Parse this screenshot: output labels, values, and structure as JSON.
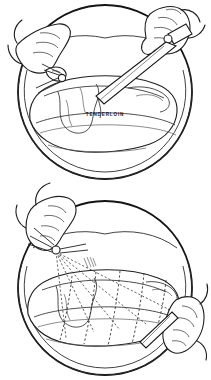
{
  "figure": {
    "style": "black-and-white line drawing",
    "panel_count": 2,
    "background_color": "#ffffff",
    "ink_color": "#1a1a1a"
  },
  "panels": [
    {
      "id": "panel-top",
      "order": 1,
      "shape": "circle",
      "center_x": 105,
      "center_y": 92,
      "radius": 88,
      "scene": "Two hands at a platter: the left hand steadies the roast with a carving fork while the right hand guides a carving knife along the edge of the tenderloin muscle.",
      "labels": [
        {
          "id": "tenderloin-label",
          "text": "TENDERLOIN",
          "x": 105,
          "y": 115,
          "style": "bold letter-spaced uppercase"
        }
      ],
      "elements": [
        "platter-rim",
        "roast",
        "tenderloin-muscle",
        "left-hand",
        "right-hand",
        "carving-knife",
        "carving-fork"
      ]
    },
    {
      "id": "panel-bottom",
      "order": 2,
      "shape": "circle",
      "center_x": 105,
      "center_y": 288,
      "radius": 88,
      "scene": "The same roast on the platter, now marked with a series of dashed parallel guide lines that show where the slices are to be cut; a hand with a fork anchors the roast at the upper left and a second hand reaches in at the lower right.",
      "labels": [],
      "elements": [
        "platter-rim",
        "roast",
        "dashed-slice-guides",
        "left-hand",
        "right-hand",
        "carving-fork",
        "carving-knife"
      ]
    }
  ],
  "slice_guides": {
    "count": 5,
    "description": "dashed parallel cut lines across the roast"
  }
}
